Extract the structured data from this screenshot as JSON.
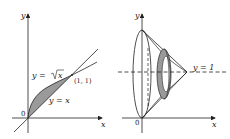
{
  "figure_left": {
    "axis_x_label": "x",
    "axis_y_label": "y",
    "origin_label": "0",
    "curve_sqrt_label_pre": "y = ",
    "curve_sqrt_label_rad": "x",
    "curve_line_label": "y = x",
    "intersection_label": "(1, 1)"
  },
  "figure_right": {
    "axis_x_label": "x",
    "axis_y_label": "y",
    "origin_label": "0",
    "axis_of_rotation_label": "y = 1"
  },
  "colors": {
    "ink": "#222222",
    "shade": "#9a9a9a",
    "background": "#ffffff"
  }
}
